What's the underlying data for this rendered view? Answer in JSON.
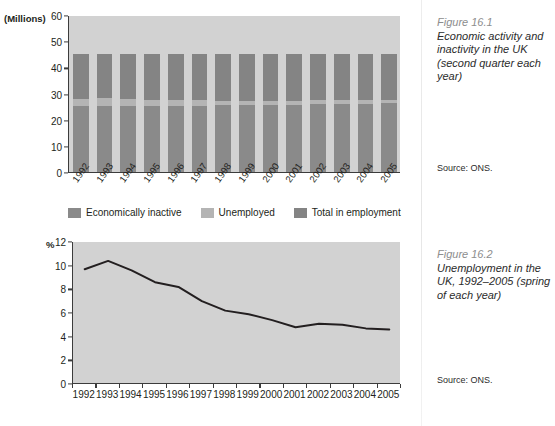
{
  "figure1": {
    "caption_number": "Figure 16.1",
    "caption_text": "Economic activity and inactivity in the UK (second quarter each year)",
    "source": "Source: ONS.",
    "axis_unit": "(Millions)",
    "legend": [
      {
        "label": "Economically inactive",
        "color": "#8a8a8a"
      },
      {
        "label": "Unemployed",
        "color": "#b4b4b4"
      },
      {
        "label": "Total in employment",
        "color": "#848484"
      }
    ]
  },
  "figure2": {
    "caption_number": "Figure 16.2",
    "caption_text": "Unemployment in the UK, 1992–2005 (spring of each year)",
    "source": "Source: ONS.",
    "axis_unit": "%"
  },
  "chart_data": [
    {
      "type": "bar",
      "title": "Economic activity and inactivity in the UK (second quarter each year)",
      "xlabel": "",
      "ylabel": "(Millions)",
      "ylim": [
        0,
        60
      ],
      "yticks": [
        0,
        10,
        20,
        30,
        40,
        50,
        60
      ],
      "grid": false,
      "legend_position": "bottom",
      "stacked": true,
      "categories": [
        "1992",
        "1993",
        "1994",
        "1995",
        "1996",
        "1997",
        "1998",
        "1999",
        "2000",
        "2001",
        "2002",
        "2003",
        "2004",
        "2005"
      ],
      "series": [
        {
          "name": "Economically inactive",
          "color": "#8a8a8a",
          "values": [
            25.2,
            25.2,
            25.3,
            25.3,
            25.3,
            25.4,
            25.5,
            25.6,
            25.7,
            25.8,
            25.9,
            26.0,
            26.1,
            26.2
          ]
        },
        {
          "name": "Unemployed",
          "color": "#b4b4b4",
          "values": [
            2.8,
            2.9,
            2.7,
            2.4,
            2.3,
            2.0,
            1.8,
            1.7,
            1.6,
            1.4,
            1.5,
            1.4,
            1.4,
            1.4
          ]
        },
        {
          "name": "Total in employment",
          "color": "#848484",
          "values": [
            17.0,
            16.9,
            17.0,
            17.3,
            17.4,
            17.6,
            17.7,
            17.7,
            17.7,
            17.8,
            17.6,
            17.6,
            17.5,
            17.4
          ]
        }
      ],
      "totals": [
        45.0,
        45.0,
        45.0,
        45.0,
        45.0,
        45.0,
        45.0,
        45.0,
        45.0,
        45.0,
        45.0,
        45.0,
        45.0,
        45.0
      ]
    },
    {
      "type": "line",
      "title": "Unemployment in the UK, 1992–2005 (spring of each year)",
      "xlabel": "",
      "ylabel": "%",
      "ylim": [
        0,
        12
      ],
      "yticks": [
        0,
        2,
        4,
        6,
        8,
        10,
        12
      ],
      "grid": false,
      "legend_position": "none",
      "x": [
        "1992",
        "1993",
        "1994",
        "1995",
        "1996",
        "1997",
        "1998",
        "1999",
        "2000",
        "2001",
        "2002",
        "2003",
        "2004",
        "2005"
      ],
      "series": [
        {
          "name": "Unemployment rate",
          "color": "#231f20",
          "values": [
            9.7,
            10.4,
            9.6,
            8.6,
            8.2,
            7.0,
            6.2,
            5.9,
            5.4,
            4.8,
            5.1,
            5.0,
            4.7,
            4.6
          ]
        }
      ]
    }
  ]
}
